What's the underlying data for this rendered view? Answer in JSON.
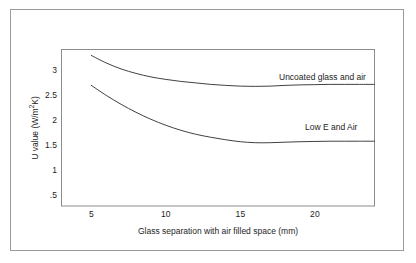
{
  "chart_data": {
    "type": "line",
    "title": "",
    "xlabel": "Glass separation with air filled space (mm)",
    "ylabel": "U value (W/m2K)",
    "ylabel_prefix": "U value (W/m",
    "ylabel_sup": "2",
    "ylabel_suffix": "K)",
    "xlim": [
      3,
      24
    ],
    "ylim": [
      0.28,
      3.42
    ],
    "grid": false,
    "legend_position": "inline-right-of-curve",
    "xticks": [
      "5",
      "10",
      "15",
      "20"
    ],
    "xtick_values": [
      5,
      10,
      15,
      20
    ],
    "yticks": [
      "3",
      "2.5",
      "2",
      "1.5",
      "1",
      ".5"
    ],
    "ytick_values": [
      3,
      2.5,
      2,
      1.5,
      1,
      0.5
    ],
    "series": [
      {
        "name": "Uncoated glass and air",
        "color": "#2b2b2b",
        "x": [
          5,
          6,
          7,
          8,
          9,
          10,
          11,
          12,
          13,
          14,
          15,
          16,
          17,
          18,
          19,
          20,
          21,
          22,
          23,
          24
        ],
        "values": [
          3.3,
          3.15,
          3.03,
          2.94,
          2.87,
          2.82,
          2.78,
          2.75,
          2.72,
          2.7,
          2.685,
          2.68,
          2.685,
          2.7,
          2.71,
          2.715,
          2.72,
          2.72,
          2.72,
          2.72
        ]
      },
      {
        "name": "Low E and Air",
        "color": "#2b2b2b",
        "x": [
          5,
          6,
          7,
          8,
          9,
          10,
          11,
          12,
          13,
          14,
          15,
          16,
          17,
          18,
          19,
          20,
          21,
          22,
          23,
          24
        ],
        "values": [
          2.7,
          2.5,
          2.32,
          2.16,
          2.02,
          1.9,
          1.8,
          1.72,
          1.66,
          1.61,
          1.57,
          1.55,
          1.55,
          1.56,
          1.57,
          1.575,
          1.58,
          1.58,
          1.58,
          1.58
        ]
      }
    ]
  },
  "frame": {
    "border_color": "#9b9b9b",
    "plot_border_color": "#8c8c8c",
    "background": "#ffffff"
  }
}
